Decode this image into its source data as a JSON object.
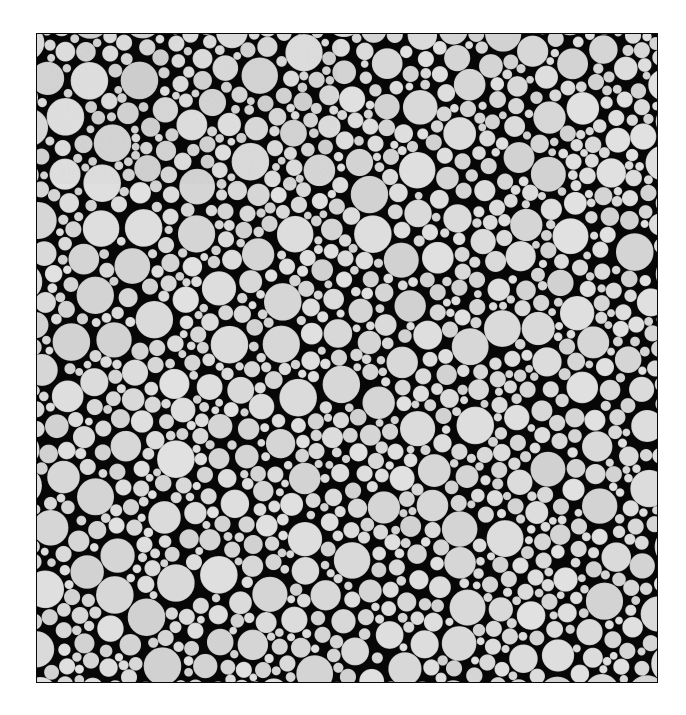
{
  "figure": {
    "kind": "disk-packing-micrograph",
    "canvas_width": 686,
    "canvas_height": 715,
    "background_color": "#ffffff"
  },
  "panel": {
    "x": 36,
    "y": 33,
    "width": 622,
    "height": 650,
    "background_color": "#070707",
    "border_color": "#0a0a0a",
    "border_width": 1
  },
  "disks": {
    "fill_color": "#d9d9d9",
    "edge_color": "#c9c9c9",
    "edge_width": 0.6,
    "min_radius": 3.6,
    "max_radius": 18.5,
    "radius_exponent": 2.15,
    "target_count": 2100,
    "placement_attempts": 240000,
    "gap": 0.55,
    "seed": 20240517,
    "packing_fraction_estimate": 0.84
  },
  "voids": [
    {
      "cx": 0.12,
      "cy": 0.3,
      "rx": 0.065,
      "ry": 0.045,
      "strength": 0.55
    },
    {
      "cx": 0.47,
      "cy": 0.21,
      "rx": 0.055,
      "ry": 0.035,
      "strength": 0.4
    },
    {
      "cx": 0.83,
      "cy": 0.62,
      "rx": 0.07,
      "ry": 0.05,
      "strength": 0.5
    },
    {
      "cx": 0.5,
      "cy": 0.7,
      "rx": 0.06,
      "ry": 0.04,
      "strength": 0.45
    },
    {
      "cx": 0.25,
      "cy": 0.78,
      "rx": 0.055,
      "ry": 0.038,
      "strength": 0.35
    },
    {
      "cx": 0.66,
      "cy": 0.45,
      "rx": 0.05,
      "ry": 0.034,
      "strength": 0.3
    }
  ],
  "size_field": [
    {
      "cx": 0.1,
      "cy": 0.12,
      "r": 0.28,
      "bias": 0.55
    },
    {
      "cx": 0.88,
      "cy": 0.08,
      "r": 0.26,
      "bias": -0.45
    },
    {
      "cx": 0.3,
      "cy": 0.55,
      "r": 0.3,
      "bias": 0.3
    },
    {
      "cx": 0.72,
      "cy": 0.3,
      "r": 0.26,
      "bias": -0.3
    },
    {
      "cx": 0.18,
      "cy": 0.88,
      "r": 0.28,
      "bias": 0.4
    },
    {
      "cx": 0.62,
      "cy": 0.86,
      "r": 0.26,
      "bias": -0.25
    },
    {
      "cx": 0.92,
      "cy": 0.55,
      "r": 0.22,
      "bias": -0.35
    },
    {
      "cx": 0.5,
      "cy": 0.4,
      "r": 0.24,
      "bias": 0.2
    }
  ],
  "chart_data": {
    "type": "scatter",
    "title": "",
    "xlabel": "",
    "ylabel": "",
    "legend": [],
    "xlim": [
      0,
      622
    ],
    "ylim": [
      0,
      650
    ],
    "grid": false,
    "note": "Each data point is a disk: centre (x, y) in panel pixel coordinates with radius r. Disks are generated deterministically from the seeded random-sequential-addition parameters in disks/voids/size_field."
  },
  "accessibility": {
    "caption": "Grayscale image of a densely packed, polydisperse two-dimensional disk packing: light gray circles of varying radii on a black background, enclosed by a thin dark rectangular frame."
  }
}
